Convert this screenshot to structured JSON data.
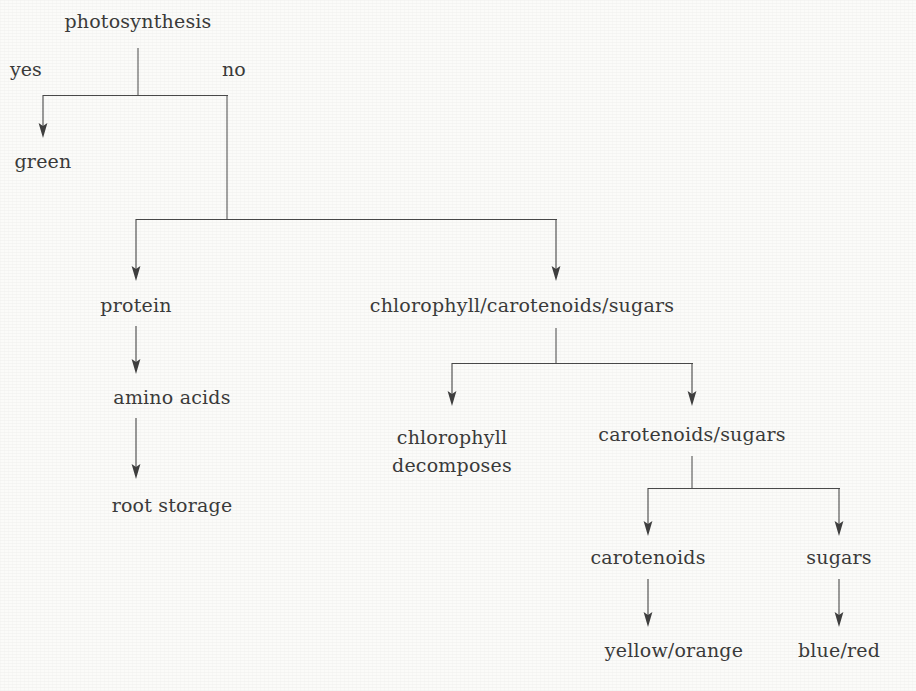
{
  "diagram": {
    "type": "decision-tree",
    "title_node": "photosynthesis",
    "background_color": "#fbfbf9",
    "line_color": "#4a4a4a",
    "text_color": "#3b3b3b",
    "edge_labels": [
      {
        "id": "yes",
        "text": "yes"
      },
      {
        "id": "no",
        "text": "no"
      }
    ],
    "nodes": [
      {
        "id": "photosynthesis",
        "text": "photosynthesis"
      },
      {
        "id": "green",
        "text": "green"
      },
      {
        "id": "protein",
        "text": "protein"
      },
      {
        "id": "amino_acids",
        "text": "amino acids"
      },
      {
        "id": "root_storage",
        "text": "root storage"
      },
      {
        "id": "chl_car_sug",
        "text": "chlorophyll/carotenoids/sugars"
      },
      {
        "id": "chlorophyll_decomposes_line1",
        "text": "chlorophyll"
      },
      {
        "id": "chlorophyll_decomposes_line2",
        "text": "decomposes"
      },
      {
        "id": "carotenoids_sugars",
        "text": "carotenoids/sugars"
      },
      {
        "id": "carotenoids",
        "text": "carotenoids"
      },
      {
        "id": "sugars",
        "text": "sugars"
      },
      {
        "id": "yellow_orange",
        "text": "yellow/orange"
      },
      {
        "id": "blue_red",
        "text": "blue/red"
      }
    ],
    "edges": [
      {
        "from": "photosynthesis",
        "to": "green",
        "label": "yes"
      },
      {
        "from": "photosynthesis",
        "to": "protein",
        "label": "no"
      },
      {
        "from": "photosynthesis",
        "to": "chl_car_sug",
        "label": "no"
      },
      {
        "from": "protein",
        "to": "amino_acids",
        "label": ""
      },
      {
        "from": "amino_acids",
        "to": "root_storage",
        "label": ""
      },
      {
        "from": "chl_car_sug",
        "to": "chlorophyll_decomposes_line1",
        "label": ""
      },
      {
        "from": "chl_car_sug",
        "to": "carotenoids_sugars",
        "label": ""
      },
      {
        "from": "carotenoids_sugars",
        "to": "carotenoids",
        "label": ""
      },
      {
        "from": "carotenoids_sugars",
        "to": "sugars",
        "label": ""
      },
      {
        "from": "carotenoids",
        "to": "yellow_orange",
        "label": ""
      },
      {
        "from": "sugars",
        "to": "blue_red",
        "label": ""
      }
    ]
  }
}
